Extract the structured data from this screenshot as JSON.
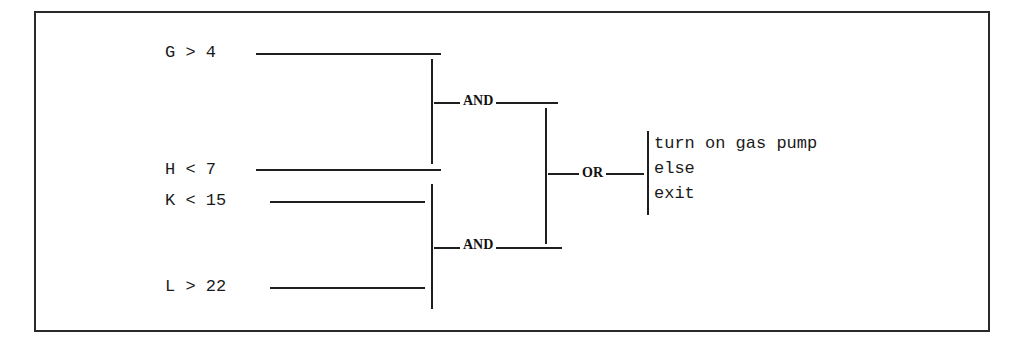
{
  "diagram": {
    "type": "logic-gate-decision-tree",
    "conditions": [
      {
        "id": "g",
        "label": "G > 4"
      },
      {
        "id": "h",
        "label": "H < 7"
      },
      {
        "id": "k",
        "label": "K < 15"
      },
      {
        "id": "l",
        "label": "L > 22"
      }
    ],
    "gates": {
      "and_top": {
        "label": "AND",
        "inputs": [
          "g",
          "h"
        ]
      },
      "and_bottom": {
        "label": "AND",
        "inputs": [
          "k",
          "l"
        ]
      },
      "or": {
        "label": "OR",
        "inputs": [
          "and_top",
          "and_bottom"
        ]
      }
    },
    "actions": [
      {
        "label": "turn on gas pump"
      },
      {
        "label": "else"
      },
      {
        "label": "exit"
      }
    ],
    "colors": {
      "line": "#1e1e1e",
      "text": "#1a1a1a",
      "background": "#ffffff"
    }
  }
}
